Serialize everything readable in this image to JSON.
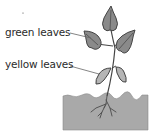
{
  "diagram": {
    "type": "labeled plant illustration",
    "labels": [
      {
        "id": "green",
        "text": "green leaves"
      },
      {
        "id": "yellow",
        "text": "yellow leaves"
      }
    ],
    "colors": {
      "green_leaf_fill": "#8a8a8a",
      "yellow_leaf_fill": "#b5b5b5",
      "soil_fill": "#a9a9a9",
      "stroke": "#444444",
      "leader_line": "#666666"
    }
  }
}
